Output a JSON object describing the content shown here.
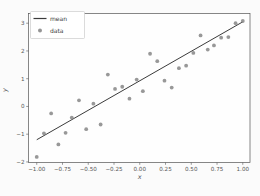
{
  "figure": {
    "background": "#fbfbfb",
    "axes_background": "#fefefe",
    "spine_color": "#555555",
    "tick_color": "#555555"
  },
  "chart_data": {
    "type": "scatter",
    "title": "",
    "xlabel": "x",
    "ylabel": "y",
    "xlim": [
      -1.08,
      1.07
    ],
    "ylim": [
      -2.02,
      3.35
    ],
    "grid": false,
    "xticks": {
      "values": [
        -1.0,
        -0.75,
        -0.5,
        -0.25,
        0.0,
        0.25,
        0.5,
        0.75,
        1.0
      ],
      "labels": [
        "−1.00",
        "−0.75",
        "−0.50",
        "−0.25",
        "0.00",
        "0.25",
        "0.50",
        "0.75",
        "1.00"
      ]
    },
    "yticks": {
      "values": [
        -2,
        -1,
        0,
        1,
        2,
        3
      ],
      "labels": [
        "−2",
        "−1",
        "0",
        "1",
        "2",
        "3"
      ]
    },
    "legend": {
      "position": "upper-left",
      "entries": [
        {
          "label": "mean",
          "type": "line",
          "color": "#3b3b3b"
        },
        {
          "label": "data",
          "type": "marker",
          "color": "#8a8a8a"
        }
      ]
    },
    "series": [
      {
        "name": "mean",
        "type": "line",
        "color": "#3b3b3b",
        "stroke_width": 1,
        "points": [
          [
            -1.0,
            -1.2
          ],
          [
            1.0,
            3.05
          ]
        ]
      },
      {
        "name": "data",
        "type": "scatter",
        "color": "#8a8a8a",
        "marker_radius": 1.9,
        "points": [
          [
            -1.0,
            -1.82
          ],
          [
            -0.93,
            -0.97
          ],
          [
            -0.86,
            -0.25
          ],
          [
            -0.79,
            -1.37
          ],
          [
            -0.72,
            -0.95
          ],
          [
            -0.66,
            -0.4
          ],
          [
            -0.59,
            0.22
          ],
          [
            -0.52,
            -0.82
          ],
          [
            -0.45,
            0.1
          ],
          [
            -0.38,
            -0.65
          ],
          [
            -0.31,
            1.15
          ],
          [
            -0.24,
            0.63
          ],
          [
            -0.17,
            0.71
          ],
          [
            -0.1,
            0.28
          ],
          [
            -0.03,
            0.97
          ],
          [
            0.03,
            0.55
          ],
          [
            0.1,
            1.9
          ],
          [
            0.17,
            1.63
          ],
          [
            0.24,
            0.93
          ],
          [
            0.31,
            0.68
          ],
          [
            0.38,
            1.38
          ],
          [
            0.45,
            1.47
          ],
          [
            0.52,
            1.93
          ],
          [
            0.59,
            2.56
          ],
          [
            0.66,
            2.05
          ],
          [
            0.72,
            2.2
          ],
          [
            0.79,
            2.48
          ],
          [
            0.86,
            2.5
          ],
          [
            0.93,
            3.0
          ],
          [
            1.0,
            3.08
          ]
        ]
      }
    ]
  }
}
